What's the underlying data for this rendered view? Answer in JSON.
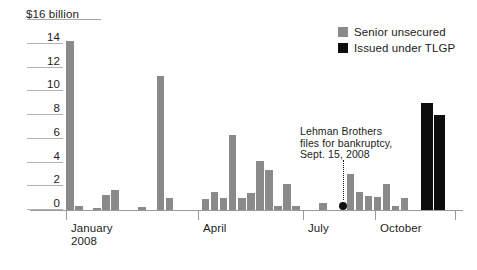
{
  "chart_data": {
    "type": "bar",
    "title": "",
    "subtitle": "",
    "xlabel": "",
    "ylabel": "$16 billion",
    "ylim": [
      0,
      16
    ],
    "ytick_labels": [
      "0",
      "2",
      "4",
      "6",
      "8",
      "10",
      "12",
      "14",
      "$16 billion"
    ],
    "ytick_values": [
      0,
      2,
      4,
      6,
      8,
      10,
      12,
      14,
      16
    ],
    "grid": false,
    "legend_position": "top-right",
    "xtick_labels": [
      "January 2008",
      "April",
      "July",
      "October"
    ],
    "xtick_label_main": [
      "January",
      "April",
      "July",
      "October"
    ],
    "xtick_label_sub": "2008",
    "series": [
      {
        "name": "Senior unsecured",
        "color": "#8a8a8a",
        "values": [
          14.2,
          0.35,
          0.0,
          0.15,
          1.3,
          1.7,
          0.0,
          0.0,
          0.25,
          0.0,
          11.3,
          1.0,
          0.0,
          0.0,
          0.0,
          0.9,
          1.5,
          1.0,
          6.3,
          1.0,
          1.4,
          4.1,
          3.4,
          0.35,
          2.2,
          0.3,
          0.0,
          0.0,
          0.55,
          0.0,
          0.0,
          3.0,
          1.5,
          1.2,
          1.1,
          2.2,
          0.35,
          1.0
        ]
      },
      {
        "name": "Issued under TLGP",
        "color": "#0d0d0d",
        "values": [
          9.0,
          8.0
        ]
      }
    ],
    "annotations": [
      {
        "name": "lehman-bankruptcy",
        "lines": [
          "Lehman Brothers",
          "files for bankruptcy,",
          "Sept. 15, 2008"
        ]
      }
    ]
  },
  "legend": {
    "items": [
      {
        "label": "Senior unsecured",
        "color": "#8a8a8a"
      },
      {
        "label": "Issued under TLGP",
        "color": "#0d0d0d"
      }
    ]
  }
}
